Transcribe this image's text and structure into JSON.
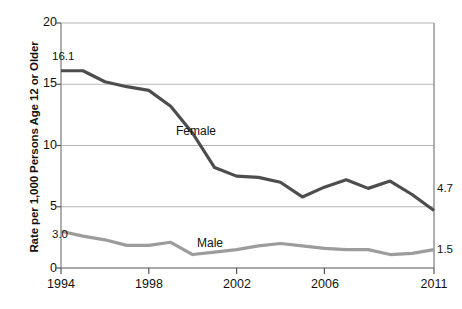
{
  "chart_data": {
    "type": "line",
    "title": "",
    "xlabel": "",
    "ylabel": "Rate per 1,000 Persons Age 12 or Older",
    "xlim": [
      1994,
      2011
    ],
    "ylim": [
      0,
      20
    ],
    "grid": true,
    "legend_position": "inline-annotation",
    "x": [
      1994,
      1995,
      1996,
      1997,
      1998,
      1999,
      2000,
      2001,
      2002,
      2003,
      2004,
      2005,
      2006,
      2007,
      2008,
      2009,
      2010,
      2011
    ],
    "xticks": [
      "1994",
      "1998",
      "2002",
      "2006",
      "2011"
    ],
    "xtick_values": [
      1994,
      1998,
      2002,
      2006,
      2011
    ],
    "yticks": [
      "0",
      "5",
      "10",
      "15",
      "20"
    ],
    "ytick_values": [
      0,
      5,
      10,
      15,
      20
    ],
    "series": [
      {
        "name": "Female",
        "color": "#4d4d4d",
        "values": [
          16.1,
          16.1,
          15.2,
          14.8,
          14.5,
          13.2,
          11.0,
          8.2,
          7.5,
          7.4,
          7.0,
          5.8,
          6.6,
          7.2,
          6.5,
          7.1,
          6.0,
          4.7
        ],
        "start_label": "16.1",
        "end_label": "4.7"
      },
      {
        "name": "Male",
        "color": "#9c9c9c",
        "values": [
          3.0,
          2.6,
          2.3,
          1.85,
          1.85,
          2.1,
          1.1,
          1.3,
          1.5,
          1.8,
          2.0,
          1.8,
          1.6,
          1.5,
          1.5,
          1.1,
          1.2,
          1.5
        ],
        "start_label": "3.0",
        "end_label": "1.5"
      }
    ],
    "annotations": [
      {
        "text": "16.1",
        "kind": "value-label",
        "series": "Female",
        "position": "start"
      },
      {
        "text": "4.7",
        "kind": "value-label",
        "series": "Female",
        "position": "end"
      },
      {
        "text": "3.0",
        "kind": "value-label",
        "series": "Male",
        "position": "start"
      },
      {
        "text": "1.5",
        "kind": "value-label",
        "series": "Male",
        "position": "end"
      },
      {
        "text": "Female",
        "kind": "series-label",
        "series": "Female"
      },
      {
        "text": "Male",
        "kind": "series-label",
        "series": "Male"
      }
    ],
    "colors": {
      "female_line": "#4d4d4d",
      "male_line": "#9c9c9c",
      "gridline": "#b5b5b5",
      "axis": "#8d8d8d",
      "text": "#111111",
      "background": "#ffffff"
    }
  },
  "axes": {
    "y_title": "Rate per 1,000 Persons Age 12 or Older",
    "y_labels": [
      "20",
      "15",
      "10",
      "5",
      "0"
    ],
    "x_labels": [
      "1994",
      "1998",
      "2002",
      "2006",
      "2011"
    ]
  },
  "labels": {
    "female_series": "Female",
    "male_series": "Male",
    "female_start": "16.1",
    "female_end": "4.7",
    "male_start": "3.0",
    "male_end": "1.5"
  }
}
